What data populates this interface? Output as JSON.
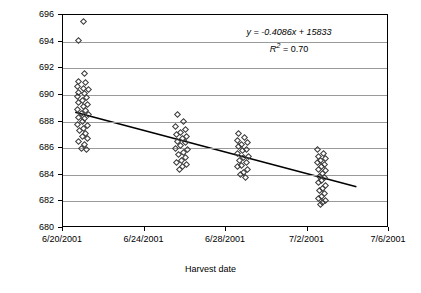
{
  "chart_data": {
    "type": "scatter",
    "title": "",
    "xlabel": "Harvest date",
    "ylabel": "Red-edge [nm]",
    "xlim": [
      "6/20/2001",
      "7/6/2001"
    ],
    "ylim": [
      680,
      696
    ],
    "ytick_labels": [
      "696",
      "694",
      "692",
      "690",
      "688",
      "686",
      "684",
      "682",
      "680"
    ],
    "xtick_labels": [
      "6/20/2001",
      "6/24/2001",
      "6/28/2001",
      "7/2/2001",
      "7/6/2001"
    ],
    "grid": "horizontal",
    "legend": "none",
    "annotations": {
      "equation": "y = -0.4086x + 15833",
      "r_squared": "R",
      "r_squared_exp": "2",
      "r_squared_value": " = 0.70"
    },
    "trendline": {
      "slope": -0.4086,
      "intercept": 15833,
      "x_start_days": 0.6,
      "y_start": 688.7,
      "x_end_days": 14.4,
      "y_end": 683.1
    },
    "series": [
      {
        "name": "Red-edge observations",
        "marker": "open-diamond",
        "points": [
          {
            "x": 1.0,
            "y": 695.5
          },
          {
            "x": 0.75,
            "y": 694.1
          },
          {
            "x": 1.05,
            "y": 691.6
          },
          {
            "x": 0.78,
            "y": 691.0
          },
          {
            "x": 1.1,
            "y": 690.9
          },
          {
            "x": 0.7,
            "y": 690.6
          },
          {
            "x": 1.0,
            "y": 690.5
          },
          {
            "x": 1.25,
            "y": 690.4
          },
          {
            "x": 0.78,
            "y": 690.2
          },
          {
            "x": 1.05,
            "y": 690.1
          },
          {
            "x": 0.72,
            "y": 689.9
          },
          {
            "x": 1.15,
            "y": 689.8
          },
          {
            "x": 0.95,
            "y": 689.6
          },
          {
            "x": 0.75,
            "y": 689.4
          },
          {
            "x": 1.2,
            "y": 689.3
          },
          {
            "x": 1.0,
            "y": 689.1
          },
          {
            "x": 0.72,
            "y": 688.9
          },
          {
            "x": 1.1,
            "y": 688.8
          },
          {
            "x": 0.9,
            "y": 688.6
          },
          {
            "x": 1.25,
            "y": 688.5
          },
          {
            "x": 0.78,
            "y": 688.3
          },
          {
            "x": 1.05,
            "y": 688.2
          },
          {
            "x": 0.95,
            "y": 688.0
          },
          {
            "x": 0.72,
            "y": 687.8
          },
          {
            "x": 1.2,
            "y": 687.7
          },
          {
            "x": 1.0,
            "y": 687.5
          },
          {
            "x": 0.8,
            "y": 687.3
          },
          {
            "x": 1.1,
            "y": 687.1
          },
          {
            "x": 0.95,
            "y": 686.9
          },
          {
            "x": 1.2,
            "y": 686.7
          },
          {
            "x": 0.75,
            "y": 686.5
          },
          {
            "x": 1.05,
            "y": 686.3
          },
          {
            "x": 0.9,
            "y": 686.0
          },
          {
            "x": 1.15,
            "y": 685.9
          },
          {
            "x": 5.6,
            "y": 688.5
          },
          {
            "x": 5.9,
            "y": 688.0
          },
          {
            "x": 5.5,
            "y": 687.6
          },
          {
            "x": 6.0,
            "y": 687.4
          },
          {
            "x": 5.75,
            "y": 687.2
          },
          {
            "x": 5.55,
            "y": 687.0
          },
          {
            "x": 6.05,
            "y": 686.9
          },
          {
            "x": 5.85,
            "y": 686.7
          },
          {
            "x": 5.6,
            "y": 686.5
          },
          {
            "x": 6.0,
            "y": 686.4
          },
          {
            "x": 5.75,
            "y": 686.2
          },
          {
            "x": 5.5,
            "y": 686.0
          },
          {
            "x": 6.1,
            "y": 685.9
          },
          {
            "x": 5.9,
            "y": 685.7
          },
          {
            "x": 5.65,
            "y": 685.5
          },
          {
            "x": 6.0,
            "y": 685.3
          },
          {
            "x": 5.8,
            "y": 685.1
          },
          {
            "x": 5.55,
            "y": 684.9
          },
          {
            "x": 6.05,
            "y": 684.8
          },
          {
            "x": 5.85,
            "y": 684.6
          },
          {
            "x": 5.7,
            "y": 684.4
          },
          {
            "x": 8.6,
            "y": 687.1
          },
          {
            "x": 8.9,
            "y": 686.8
          },
          {
            "x": 8.55,
            "y": 686.6
          },
          {
            "x": 9.05,
            "y": 686.4
          },
          {
            "x": 8.75,
            "y": 686.3
          },
          {
            "x": 8.6,
            "y": 686.1
          },
          {
            "x": 9.0,
            "y": 685.9
          },
          {
            "x": 8.8,
            "y": 685.8
          },
          {
            "x": 8.55,
            "y": 685.6
          },
          {
            "x": 9.1,
            "y": 685.4
          },
          {
            "x": 8.85,
            "y": 685.3
          },
          {
            "x": 8.65,
            "y": 685.1
          },
          {
            "x": 9.0,
            "y": 684.9
          },
          {
            "x": 8.75,
            "y": 684.7
          },
          {
            "x": 8.55,
            "y": 684.6
          },
          {
            "x": 9.05,
            "y": 684.4
          },
          {
            "x": 8.85,
            "y": 684.2
          },
          {
            "x": 8.7,
            "y": 684.0
          },
          {
            "x": 8.95,
            "y": 683.8
          },
          {
            "x": 12.5,
            "y": 685.9
          },
          {
            "x": 12.8,
            "y": 685.6
          },
          {
            "x": 12.55,
            "y": 685.4
          },
          {
            "x": 12.9,
            "y": 685.2
          },
          {
            "x": 12.65,
            "y": 685.1
          },
          {
            "x": 12.5,
            "y": 684.9
          },
          {
            "x": 12.85,
            "y": 684.8
          },
          {
            "x": 12.7,
            "y": 684.6
          },
          {
            "x": 12.55,
            "y": 684.4
          },
          {
            "x": 12.9,
            "y": 684.3
          },
          {
            "x": 12.75,
            "y": 684.1
          },
          {
            "x": 12.6,
            "y": 683.9
          },
          {
            "x": 12.85,
            "y": 683.8
          },
          {
            "x": 12.7,
            "y": 683.6
          },
          {
            "x": 12.55,
            "y": 683.4
          },
          {
            "x": 12.9,
            "y": 683.2
          },
          {
            "x": 12.75,
            "y": 683.0
          },
          {
            "x": 12.6,
            "y": 682.8
          },
          {
            "x": 12.85,
            "y": 682.6
          },
          {
            "x": 12.7,
            "y": 682.4
          },
          {
            "x": 12.55,
            "y": 682.2
          },
          {
            "x": 12.9,
            "y": 682.1
          },
          {
            "x": 12.75,
            "y": 681.9
          },
          {
            "x": 12.62,
            "y": 681.8
          }
        ]
      }
    ]
  }
}
